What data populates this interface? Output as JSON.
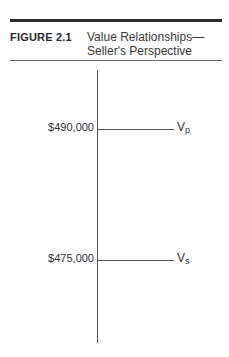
{
  "figure": {
    "label": "FIGURE 2.1",
    "title_line1": "Value Relationships—",
    "title_line2": "Seller's Perspective"
  },
  "diagram": {
    "levels": [
      {
        "value": "$490,000",
        "symbol": "V",
        "subscript": "p"
      },
      {
        "value": "$475,000",
        "symbol": "V",
        "subscript": "s"
      }
    ]
  }
}
